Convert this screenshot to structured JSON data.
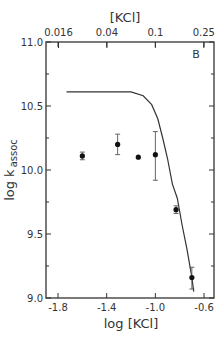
{
  "chart_data": {
    "type": "scatter",
    "panel_label": "B",
    "title": "",
    "xlabel": "log [KCl]",
    "ylabel": "log k",
    "ylabel_sub": "assoc",
    "top_xlabel": "[KCl]",
    "xlim": [
      -1.85,
      -0.52
    ],
    "ylim": [
      9.0,
      11.0
    ],
    "grid": false,
    "legend": null,
    "x_ticks": [
      -1.8,
      -1.4,
      -1.0,
      -0.6
    ],
    "x_tick_labels": [
      "-1.8",
      "-1.4",
      "-1.0",
      "-0.6"
    ],
    "x_minor_ticks": [],
    "top_ticks_log": [
      -1.796,
      -1.398,
      -1.0,
      -0.602
    ],
    "top_tick_labels": [
      "0.016",
      "0.04",
      "0.1",
      "0.25"
    ],
    "y_ticks": [
      9.0,
      9.5,
      10.0,
      10.5,
      11.0
    ],
    "y_tick_labels": [
      "9.0",
      "9.5",
      "10.0",
      "10.5",
      "11.0"
    ],
    "y_minor_ticks": [
      9.25,
      9.75,
      10.25,
      10.75
    ],
    "series": [
      {
        "name": "measured",
        "type": "scatter",
        "points": [
          {
            "x": -1.6,
            "y": 10.11,
            "err_lo": 10.08,
            "err_hi": 10.14
          },
          {
            "x": -1.31,
            "y": 10.2,
            "err_lo": 10.12,
            "err_hi": 10.28
          },
          {
            "x": -1.14,
            "y": 10.1,
            "err_lo": null,
            "err_hi": null
          },
          {
            "x": -1.0,
            "y": 10.12,
            "err_lo": 9.92,
            "err_hi": 10.3
          },
          {
            "x": -0.83,
            "y": 9.69,
            "err_lo": 9.66,
            "err_hi": 9.72
          },
          {
            "x": -0.7,
            "y": 9.16,
            "err_lo": 9.07,
            "err_hi": 9.24
          }
        ]
      },
      {
        "name": "theoretical",
        "type": "line",
        "x": [
          -1.73,
          -1.4,
          -1.2,
          -1.1,
          -1.03,
          -0.98,
          -0.94,
          -0.9,
          -0.86,
          -0.82,
          -0.78,
          -0.74,
          -0.7,
          -0.685
        ],
        "y": [
          10.61,
          10.61,
          10.61,
          10.58,
          10.51,
          10.4,
          10.25,
          10.09,
          9.89,
          9.78,
          9.57,
          9.38,
          9.16,
          9.05
        ]
      }
    ]
  }
}
